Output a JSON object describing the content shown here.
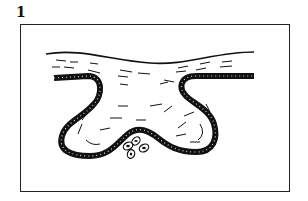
{
  "figure": {
    "label": "1",
    "elements": [
      {
        "name": "surface-layer",
        "description": "wavy top surface line with hatch strokes"
      },
      {
        "name": "epithelial-band",
        "description": "thick black dotted band forming a W-shaped fold"
      },
      {
        "name": "cell-cluster",
        "description": "four small oval cells beneath the central fold"
      }
    ],
    "colors": {
      "ink": "#111111",
      "background": "#ffffff",
      "frame": "#222222"
    }
  }
}
